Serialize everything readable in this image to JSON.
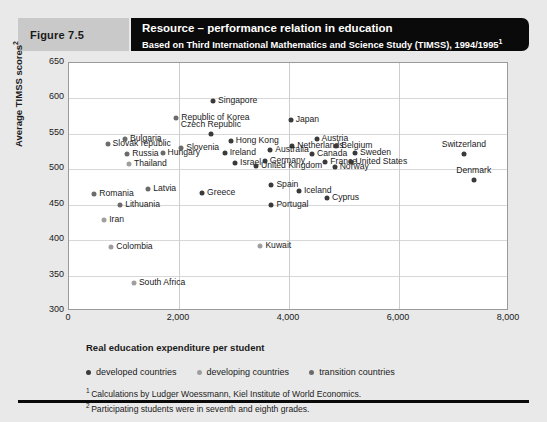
{
  "header": {
    "figure_label": "Figure 7.5",
    "title_main": "Resource – performance relation in education",
    "title_sub": "Based on Third International Mathematics and Science Study (TIMSS), 1994/1995",
    "title_sub_mark": "1"
  },
  "axis": {
    "x_caption": "Real education expenditure per student",
    "y_caption": "Average TIMSS scores",
    "y_caption_mark": "2",
    "x_ticks": [
      "0",
      "2,000",
      "4,000",
      "6,000",
      "8,000"
    ],
    "y_ticks": [
      "300",
      "350",
      "400",
      "450",
      "500",
      "550",
      "600",
      "650"
    ]
  },
  "legend": {
    "items": [
      {
        "label": "developed countries",
        "key": "developed",
        "color": "#3a3a3a"
      },
      {
        "label": "developing countries",
        "key": "developing",
        "color": "#9e9e9e"
      },
      {
        "label": "transition countries",
        "key": "transition",
        "color": "#6b6b6b"
      }
    ]
  },
  "footnotes": [
    {
      "mark": "1",
      "text": "Calculations by Ludger Woessmann, Kiel Institute of World Economics."
    },
    {
      "mark": "2",
      "text": "Participating students were in seventh and eighth grades."
    }
  ],
  "chart_data": {
    "type": "scatter",
    "title": "Resource – performance relation in education",
    "subtitle": "Based on Third International Mathematics and Science Study (TIMSS), 1994/1995",
    "xlabel": "Real education expenditure per student",
    "ylabel": "Average TIMSS scores",
    "xlim": [
      0,
      8000
    ],
    "ylim": [
      300,
      650
    ],
    "xtick_step": 2000,
    "ytick_step": 50,
    "grid": "both",
    "legend_position": "below-plot",
    "series": [
      {
        "name": "developed countries",
        "color": "#3a3a3a",
        "points": [
          {
            "label": "Singapore",
            "x": 2620,
            "y": 597,
            "lpos": "right"
          },
          {
            "label": "Japan",
            "x": 4030,
            "y": 570,
            "lpos": "right"
          },
          {
            "label": "Czech Republic",
            "x": 2580,
            "y": 550,
            "lpos": "above"
          },
          {
            "label": "Hong Kong",
            "x": 2940,
            "y": 540,
            "lpos": "right"
          },
          {
            "label": "Austria",
            "x": 4500,
            "y": 543,
            "lpos": "right"
          },
          {
            "label": "Netherlands",
            "x": 4060,
            "y": 533,
            "lpos": "right"
          },
          {
            "label": "Belgium",
            "x": 4860,
            "y": 533,
            "lpos": "right"
          },
          {
            "label": "Australia",
            "x": 3660,
            "y": 527,
            "lpos": "right"
          },
          {
            "label": "Sweden",
            "x": 5200,
            "y": 523,
            "lpos": "right"
          },
          {
            "label": "Switzerland",
            "x": 7180,
            "y": 521,
            "lpos": "above"
          },
          {
            "label": "Canada",
            "x": 4420,
            "y": 521,
            "lpos": "right"
          },
          {
            "label": "Ireland",
            "x": 2830,
            "y": 523,
            "lpos": "right"
          },
          {
            "label": "Germany",
            "x": 3560,
            "y": 512,
            "lpos": "right"
          },
          {
            "label": "France",
            "x": 4660,
            "y": 510,
            "lpos": "right"
          },
          {
            "label": "United States",
            "x": 5120,
            "y": 510,
            "lpos": "right"
          },
          {
            "label": "Israel",
            "x": 3020,
            "y": 509,
            "lpos": "right"
          },
          {
            "label": "United Kingdom",
            "x": 3400,
            "y": 504,
            "lpos": "right"
          },
          {
            "label": "Norway",
            "x": 4830,
            "y": 503,
            "lpos": "right"
          },
          {
            "label": "Spain",
            "x": 3680,
            "y": 478,
            "lpos": "right"
          },
          {
            "label": "Iceland",
            "x": 4180,
            "y": 470,
            "lpos": "right"
          },
          {
            "label": "Denmark",
            "x": 7360,
            "y": 485,
            "lpos": "above"
          },
          {
            "label": "Greece",
            "x": 2420,
            "y": 467,
            "lpos": "right"
          },
          {
            "label": "Portugal",
            "x": 3680,
            "y": 450,
            "lpos": "right"
          },
          {
            "label": "Cyprus",
            "x": 4690,
            "y": 459,
            "lpos": "right"
          }
        ]
      },
      {
        "name": "developing countries",
        "color": "#9e9e9e",
        "points": [
          {
            "label": "Thailand",
            "x": 1090,
            "y": 508,
            "lpos": "right"
          },
          {
            "label": "Iran",
            "x": 640,
            "y": 429,
            "lpos": "right"
          },
          {
            "label": "Colombia",
            "x": 770,
            "y": 391,
            "lpos": "right"
          },
          {
            "label": "South Africa",
            "x": 1180,
            "y": 340,
            "lpos": "right"
          },
          {
            "label": "Kuwait",
            "x": 3480,
            "y": 392,
            "lpos": "right"
          }
        ]
      },
      {
        "name": "transition countries",
        "color": "#6b6b6b",
        "points": [
          {
            "label": "Republic of Korea",
            "x": 1950,
            "y": 572,
            "lpos": "right"
          },
          {
            "label": "Bulgaria",
            "x": 1020,
            "y": 543,
            "lpos": "right"
          },
          {
            "label": "Slovak republic",
            "x": 700,
            "y": 535,
            "lpos": "right"
          },
          {
            "label": "Slovenia",
            "x": 2040,
            "y": 530,
            "lpos": "right"
          },
          {
            "label": "Russia",
            "x": 1060,
            "y": 522,
            "lpos": "right"
          },
          {
            "label": "Hungary",
            "x": 1700,
            "y": 523,
            "lpos": "right"
          },
          {
            "label": "Latvia",
            "x": 1440,
            "y": 472,
            "lpos": "right"
          },
          {
            "label": "Romania",
            "x": 460,
            "y": 465,
            "lpos": "right"
          },
          {
            "label": "Lithuania",
            "x": 930,
            "y": 449,
            "lpos": "right"
          }
        ]
      }
    ]
  }
}
